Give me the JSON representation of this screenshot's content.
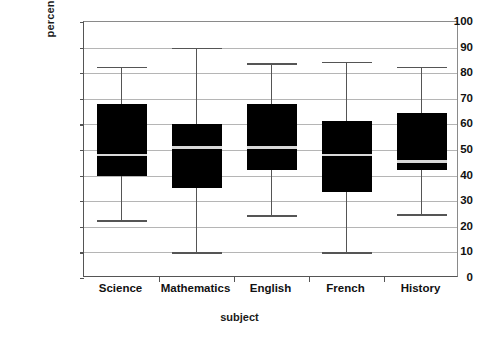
{
  "chart_data": {
    "type": "box",
    "title": "",
    "xlabel": "subject",
    "ylabel": "percentage mark",
    "categories": [
      "Science",
      "Mathematics",
      "English",
      "French",
      "History"
    ],
    "ylim": [
      0,
      100
    ],
    "yticks": [
      0,
      10,
      20,
      30,
      40,
      50,
      60,
      70,
      80,
      90,
      100
    ],
    "ytick_labels": [
      "0",
      "10",
      "20",
      "30",
      "40",
      "50",
      "60",
      "70",
      "80",
      "90",
      "100"
    ],
    "grid": true,
    "legend": "none",
    "box_color": "#000000",
    "median_color": "#d8d8d8",
    "whisker_color": "#555555",
    "gridline_color": "#b5b5b5",
    "boxes": [
      {
        "category": "Science",
        "min": 22.5,
        "q1": 40.0,
        "median": 48.0,
        "q3": 68.0,
        "max": 82.5
      },
      {
        "category": "Mathematics",
        "min": 10.0,
        "q1": 35.0,
        "median": 51.0,
        "q3": 60.0,
        "max": 90.0
      },
      {
        "category": "English",
        "min": 24.5,
        "q1": 42.0,
        "median": 51.0,
        "q3": 68.0,
        "max": 84.0
      },
      {
        "category": "French",
        "min": 10.0,
        "q1": 33.5,
        "median": 48.0,
        "q3": 61.5,
        "max": 84.5
      },
      {
        "category": "History",
        "min": 25.0,
        "q1": 42.0,
        "median": 45.5,
        "q3": 64.5,
        "max": 82.5
      }
    ]
  }
}
